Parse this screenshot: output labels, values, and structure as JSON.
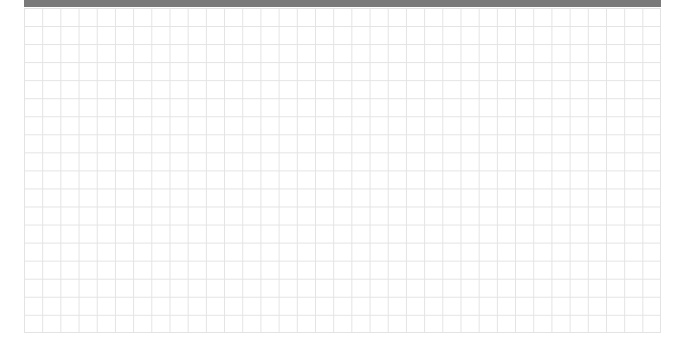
{
  "header_bar": {
    "color": "#7a7a7a"
  },
  "grid": {
    "columns": 35,
    "rows": 18,
    "line_color": "#e3e3e3",
    "background": "#ffffff"
  }
}
